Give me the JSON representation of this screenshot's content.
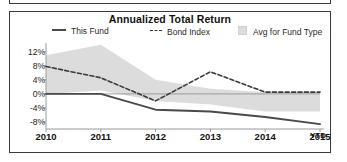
{
  "chart_data": {
    "type": "line",
    "title": "Annualized Total Return",
    "xlabel": "",
    "ylabel": "",
    "x": [
      2010,
      2011,
      2012,
      2013,
      2014,
      2015
    ],
    "xtick_labels": [
      "2010",
      "2011",
      "2012",
      "2013",
      "2014",
      "2015"
    ],
    "x_annotation": "YTD",
    "ytick_labels": [
      "12%",
      "8%",
      "4%",
      "0%",
      "-4%",
      "-8%"
    ],
    "ytick_values": [
      12,
      8,
      4,
      0,
      -4,
      -8
    ],
    "ylim": [
      -10,
      14.5
    ],
    "grid": false,
    "legend_position": "top",
    "series": [
      {
        "name": "This Fund",
        "style": "solid",
        "color": "#4a4a4a",
        "values": [
          0.0,
          0.0,
          -4.5,
          -5.0,
          -6.6,
          -8.6
        ]
      },
      {
        "name": "Bond Index",
        "style": "dashed",
        "color": "#3a3a3a",
        "values": [
          7.8,
          4.6,
          -2.0,
          6.3,
          0.5,
          0.5
        ]
      },
      {
        "name": "Avg for Fund Type",
        "style": "band",
        "color": "#dcdcdc",
        "upper": [
          11.0,
          14.0,
          4.0,
          1.5,
          0.5,
          0.5
        ],
        "lower": [
          0.0,
          1.0,
          -2.0,
          -3.0,
          -5.0,
          -5.0
        ]
      }
    ]
  },
  "chart": {
    "title": "Annualized Total Return",
    "legend": {
      "this_fund": "This Fund",
      "bond_index": "Bond Index",
      "avg_for_fund_type": "Avg for Fund Type"
    },
    "ytd": "YTD"
  }
}
